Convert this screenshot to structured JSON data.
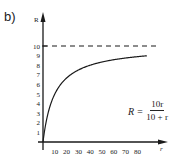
{
  "panel_label": "b)",
  "formula": {
    "lhs": "R =",
    "numerator": "10r",
    "denominator": "10 + r",
    "text": "R = 10r / (10 + r)"
  },
  "chart_data": {
    "type": "line",
    "title": "",
    "panel": "b)",
    "xlabel": "r",
    "ylabel": "R",
    "xlim": [
      0,
      90
    ],
    "ylim": [
      0,
      11
    ],
    "x_ticks": [
      10,
      20,
      30,
      40,
      50,
      60,
      70,
      80
    ],
    "x_tick_labels": [
      "10",
      "20",
      "30",
      "40",
      "50",
      "60",
      "70",
      "80"
    ],
    "y_ticks": [
      1,
      2,
      3,
      4,
      5,
      6,
      7,
      8,
      9,
      10
    ],
    "y_tick_labels": [
      "1",
      "2",
      "3",
      "4",
      "5",
      "6",
      "7",
      "8",
      "9",
      "10"
    ],
    "grid": false,
    "legend": null,
    "series": [
      {
        "name": "R = 10r/(10+r)",
        "style": "solid",
        "x": [
          0,
          1,
          2,
          5,
          10,
          15,
          20,
          30,
          40,
          50,
          60,
          70,
          80,
          88
        ],
        "values": [
          0,
          0.91,
          1.67,
          3.33,
          5.0,
          6.0,
          6.67,
          7.5,
          8.0,
          8.33,
          8.57,
          8.75,
          8.89,
          8.98
        ]
      },
      {
        "name": "asymptote R = 10",
        "style": "dashed",
        "x": [
          0,
          88
        ],
        "values": [
          10,
          10
        ]
      }
    ],
    "annotations": [
      {
        "text": "R = 10r / (10 + r)",
        "position": "right, below asymptote"
      }
    ]
  }
}
